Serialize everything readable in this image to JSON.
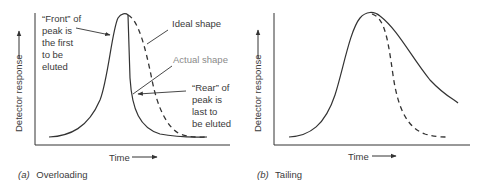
{
  "figure": {
    "panels": [
      {
        "id": "a",
        "caption_letter": "(a)",
        "caption_text": "Overloading",
        "xlabel": "Time",
        "ylabel": "Detector response",
        "annotations": {
          "front": [
            "“Front” of",
            "peak is",
            "the first",
            "to be",
            "eluted"
          ],
          "ideal": "Ideal shape",
          "actual": "Actual shape",
          "rear": [
            "“Rear” of",
            "peak is",
            "last to",
            "be eluted"
          ]
        }
      },
      {
        "id": "b",
        "caption_letter": "(b)",
        "caption_text": "Tailing",
        "xlabel": "Time",
        "ylabel": "Detector response"
      }
    ],
    "legend": {
      "solid": "Actual shape",
      "dashed": "Ideal shape"
    },
    "colors": {
      "line": "#333333",
      "actual_label": "#8a8a8a"
    }
  }
}
